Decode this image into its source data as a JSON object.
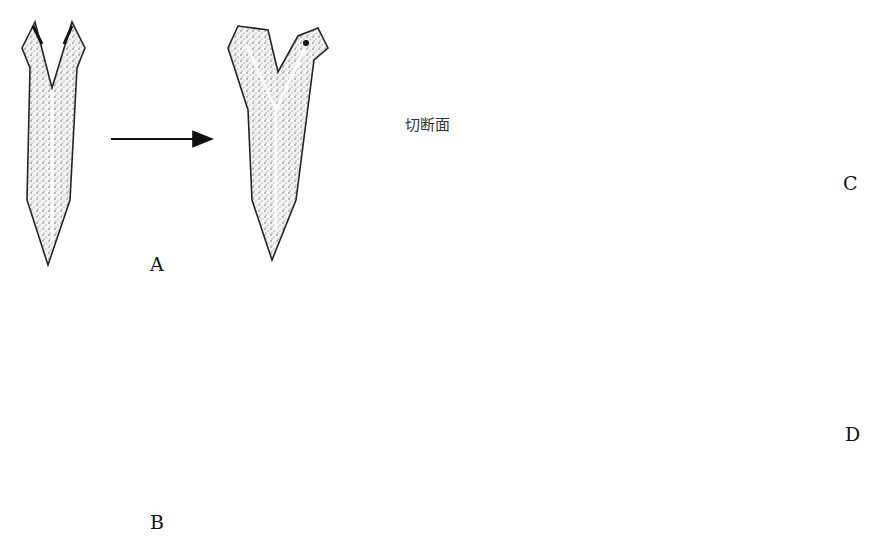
{
  "figure": {
    "labels": {
      "A": "A",
      "B": "B",
      "C": "C",
      "D": "D",
      "cut_plane": "切断面"
    },
    "panels": [
      {
        "id": "A",
        "description": "head split longitudinally regenerates into two-headed worm"
      },
      {
        "id": "B",
        "description": "tail split longitudinally regenerates into two-tailed worm"
      },
      {
        "id": "C",
        "description": "longitudinal half regenerates into full worm over stages"
      },
      {
        "id": "D",
        "description": "with starvation, regenerated worm shrinks over stages"
      }
    ]
  }
}
